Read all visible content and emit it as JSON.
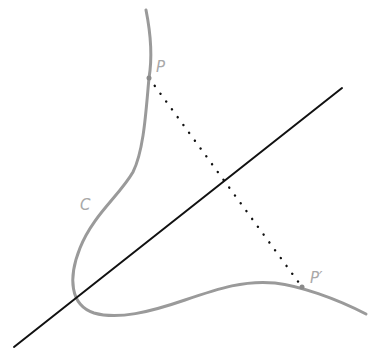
{
  "diagram": {
    "type": "reflection-of-curve-across-line",
    "labels": {
      "point": "P",
      "image_point": "P′",
      "curve": "C"
    },
    "colors": {
      "curve": "#9a9a9a",
      "axis_line": "#111111",
      "dotted_segment": "#111111",
      "label": "#a8a8a8",
      "background": "#ffffff"
    },
    "geometry": {
      "axis_line": {
        "x1": 14,
        "y1": 347,
        "x2": 342,
        "y2": 88
      },
      "point_P": {
        "x": 149,
        "y": 78
      },
      "point_P_prime": {
        "x": 302,
        "y": 287
      },
      "curve_path": "M146 10 C 151 35, 152 60, 149 78 C 146 110, 144 150, 133 172 C 120 195, 93 215, 80 248 C 68 278, 70 305, 94 313 C 118 320, 150 312, 185 300 C 220 288, 245 280, 275 283 C 300 286, 335 298, 366 314",
      "label_P_pos": {
        "x": 156,
        "y": 72
      },
      "label_P_prime_pos": {
        "x": 310,
        "y": 283
      },
      "label_C_pos": {
        "x": 80,
        "y": 210
      }
    }
  }
}
